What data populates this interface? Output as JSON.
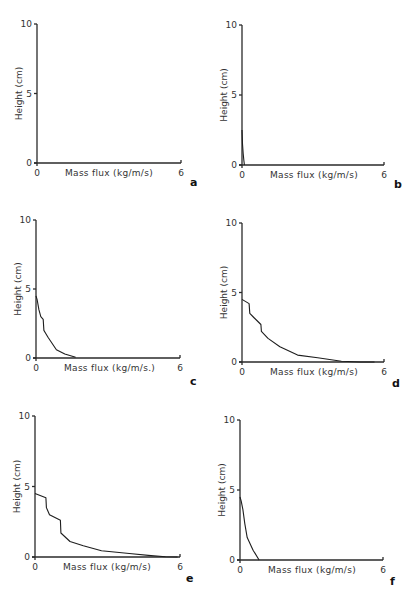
{
  "figure": {
    "panel_labels": [
      "a",
      "b",
      "c",
      "d",
      "e",
      "f"
    ]
  },
  "chart_data": [
    {
      "panel": "a",
      "type": "line",
      "xlabel": "Mass flux (kg/m/s)",
      "ylabel": "Height (cm)",
      "xlim": [
        0,
        6
      ],
      "ylim": [
        0,
        10
      ],
      "x_ticks": [
        "0",
        "6"
      ],
      "y_ticks": [
        "0",
        "5",
        "10"
      ],
      "grid": false,
      "series": [
        {
          "name": "profile",
          "x": [],
          "y": []
        }
      ]
    },
    {
      "panel": "b",
      "type": "line",
      "xlabel": "Mass flux (kg/m/s)",
      "ylabel": "Height (cm)",
      "xlim": [
        0,
        6
      ],
      "ylim": [
        0,
        10
      ],
      "x_ticks": [
        "0",
        "6"
      ],
      "y_ticks": [
        "0",
        "5",
        "10"
      ],
      "grid": false,
      "series": [
        {
          "name": "profile",
          "x": [
            0,
            0.02,
            0.05,
            0.08,
            0.1
          ],
          "y": [
            2.5,
            1.5,
            0.8,
            0.3,
            0
          ]
        }
      ]
    },
    {
      "panel": "c",
      "type": "line",
      "xlabel": "Mass flux (kg/m/s.)",
      "ylabel": "Height (cm)",
      "xlim": [
        0,
        6
      ],
      "ylim": [
        0,
        10
      ],
      "x_ticks": [
        "0",
        "6"
      ],
      "y_ticks": [
        "0",
        "5",
        "10"
      ],
      "grid": false,
      "series": [
        {
          "name": "profile",
          "x": [
            0,
            0.05,
            0.12,
            0.2,
            0.3,
            0.33,
            0.4,
            0.5,
            0.85,
            1.2,
            1.65
          ],
          "y": [
            4.5,
            4.2,
            3.5,
            3.0,
            2.8,
            2.0,
            1.8,
            1.5,
            0.6,
            0.3,
            0.05
          ]
        }
      ]
    },
    {
      "panel": "d",
      "type": "line",
      "xlabel": "Mass flux (kg/m/s)",
      "ylabel": "Height (cm)",
      "xlim": [
        0,
        6
      ],
      "ylim": [
        0,
        10
      ],
      "x_ticks": [
        "0",
        "6"
      ],
      "y_ticks": [
        "0",
        "5",
        "10"
      ],
      "grid": false,
      "series": [
        {
          "name": "profile",
          "x": [
            0,
            0.3,
            0.33,
            0.5,
            0.8,
            0.82,
            1.1,
            1.6,
            2.35,
            3.2,
            4.2,
            5.0,
            5.6
          ],
          "y": [
            4.5,
            4.2,
            3.5,
            3.2,
            2.7,
            2.2,
            1.7,
            1.1,
            0.5,
            0.3,
            0.05,
            0,
            0
          ]
        }
      ]
    },
    {
      "panel": "e",
      "type": "line",
      "xlabel": "Mass flux (kg/m/s)",
      "ylabel": "Height (cm)",
      "xlim": [
        0,
        6
      ],
      "ylim": [
        0,
        10
      ],
      "x_ticks": [
        "0",
        "6"
      ],
      "y_ticks": [
        "0",
        "5",
        "10"
      ],
      "grid": false,
      "series": [
        {
          "name": "profile",
          "x": [
            0,
            0.45,
            0.47,
            0.6,
            1.05,
            1.07,
            1.45,
            2.0,
            2.75,
            3.9,
            4.8,
            5.4,
            5.9
          ],
          "y": [
            4.5,
            4.2,
            3.5,
            3.0,
            2.6,
            1.7,
            1.1,
            0.8,
            0.45,
            0.25,
            0.1,
            0.02,
            0
          ]
        }
      ]
    },
    {
      "panel": "f",
      "type": "line",
      "xlabel": "Mass flux (kg/m/s)",
      "ylabel": "Height (cm)",
      "xlim": [
        0,
        6
      ],
      "ylim": [
        0,
        10
      ],
      "x_ticks": [
        "0",
        "6"
      ],
      "y_ticks": [
        "0",
        "5",
        "10"
      ],
      "grid": false,
      "series": [
        {
          "name": "profile",
          "x": [
            0,
            0.05,
            0.12,
            0.2,
            0.3,
            0.55,
            0.8
          ],
          "y": [
            4.5,
            4.2,
            3.6,
            2.6,
            1.6,
            0.7,
            0
          ]
        }
      ]
    }
  ],
  "layout": [
    {
      "ox": 37,
      "oy": 163,
      "x6": 181,
      "y10": 24,
      "label_x": 190,
      "label_y": 186
    },
    {
      "ox": 242,
      "oy": 165,
      "x6": 384,
      "y10": 25,
      "label_x": 394,
      "label_y": 188
    },
    {
      "ox": 36,
      "oy": 358,
      "x6": 180,
      "y10": 220,
      "label_x": 190,
      "label_y": 385
    },
    {
      "ox": 242,
      "oy": 362,
      "x6": 384,
      "y10": 223,
      "label_x": 392,
      "label_y": 387
    },
    {
      "ox": 35,
      "oy": 557,
      "x6": 180,
      "y10": 416,
      "label_x": 186,
      "label_y": 582
    },
    {
      "ox": 240,
      "oy": 560,
      "x6": 383,
      "y10": 420,
      "label_x": 390,
      "label_y": 585
    }
  ]
}
